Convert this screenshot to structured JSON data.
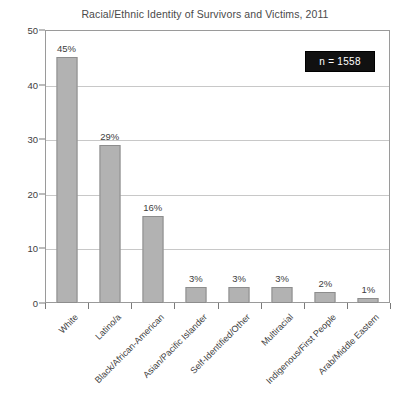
{
  "chart_data": {
    "type": "bar",
    "title": "Racial/Ethnic Identity of Survivors and Victims, 2011",
    "xlabel": "",
    "ylabel": "",
    "ylim": [
      0,
      50
    ],
    "yticks": [
      0,
      10,
      20,
      30,
      40,
      50
    ],
    "grid": true,
    "legend": null,
    "categories": [
      "White",
      "Latino/a",
      "Black/African-American",
      "Asian/Pacific Islander",
      "Self-Identified/Other",
      "Multiracial",
      "Indigenous/First People",
      "Arab/Middle Eastern"
    ],
    "values": [
      45,
      29,
      16,
      3,
      3,
      3,
      2,
      1
    ],
    "data_labels": [
      "45%",
      "29%",
      "16%",
      "3%",
      "3%",
      "3%",
      "2%",
      "1%"
    ],
    "annotations": [
      {
        "text": "n = 1558",
        "position": "top-right"
      }
    ],
    "colors": {
      "bar_fill": "#b2b2b2",
      "bar_stroke": "#8d8d8d",
      "gridline": "#c8c8c8",
      "axis": "#9a9a9a",
      "text": "#3d3d3d",
      "badge_background": "#111111",
      "badge_text": "#ffffff",
      "background": "#ffffff"
    }
  },
  "annotation": {
    "n_label": "n = 1558"
  }
}
